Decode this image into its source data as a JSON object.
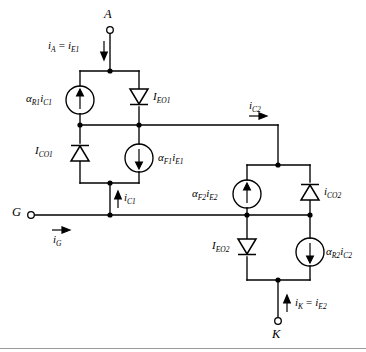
{
  "diagram": {
    "type": "circuit-schematic",
    "background": "#ffffff",
    "wire_color": "#000000",
    "terminals": [
      {
        "id": "anode",
        "label": "A",
        "x": 110,
        "y": 29,
        "name": "terminal-a"
      },
      {
        "id": "gate",
        "label": "G",
        "x": 30,
        "y": 215,
        "name": "terminal-g"
      },
      {
        "id": "cathode",
        "label": "K",
        "x": 278,
        "y": 322,
        "name": "terminal-k"
      }
    ],
    "components": {
      "src_aR1iC1": {
        "label_alpha": "α",
        "sub1": "R1",
        "i": "i",
        "sub2": "C1",
        "arrow": "up",
        "name": "current-source-alpha-r1-ic1"
      },
      "diode_IEO1": {
        "label_I": "I",
        "sub": "EO1",
        "orientation": "down",
        "name": "diode-ieo1"
      },
      "diode_ICO1": {
        "label_I": "I",
        "sub": "CO1",
        "orientation": "up",
        "name": "diode-ico1"
      },
      "src_aF1iE1": {
        "label_alpha": "α",
        "sub1": "F1",
        "i": "i",
        "sub2": "E1",
        "arrow": "down",
        "name": "current-source-alpha-f1-ie1"
      },
      "src_aF2iE2": {
        "label_alpha": "α",
        "sub1": "F2",
        "i": "i",
        "sub2": "E2",
        "arrow": "up",
        "name": "current-source-alpha-f2-ie2"
      },
      "diode_ICO2": {
        "label_I": "i",
        "sub": "CO2",
        "orientation": "up",
        "name": "diode-ico2"
      },
      "diode_IEO2": {
        "label_I": "I",
        "sub": "EO2",
        "orientation": "down",
        "name": "diode-ieo2"
      },
      "src_aR2iC2": {
        "label_alpha": "α",
        "sub1": "R2",
        "i": "i",
        "sub2": "C2",
        "arrow": "down",
        "name": "current-source-alpha-r2-ic2"
      }
    },
    "current_labels": {
      "iA": {
        "text_i": "i",
        "sub_a": "A",
        "eq": "=",
        "text_i2": "i",
        "sub_b": "E1",
        "arrow": "down",
        "name": "current-label-ia"
      },
      "iC2": {
        "text_i": "i",
        "sub_a": "C2",
        "arrow": "right",
        "name": "current-label-ic2"
      },
      "iC1": {
        "text_i": "i",
        "sub_a": "C1",
        "arrow": "up",
        "name": "current-label-ic1"
      },
      "iG": {
        "text_i": "i",
        "sub_a": "G",
        "arrow": "right",
        "name": "current-label-ig"
      },
      "iK": {
        "text_i": "i",
        "sub_a": "K",
        "eq": "=",
        "text_i2": "i",
        "sub_b": "E2",
        "arrow": "up",
        "name": "current-label-ik"
      }
    }
  }
}
